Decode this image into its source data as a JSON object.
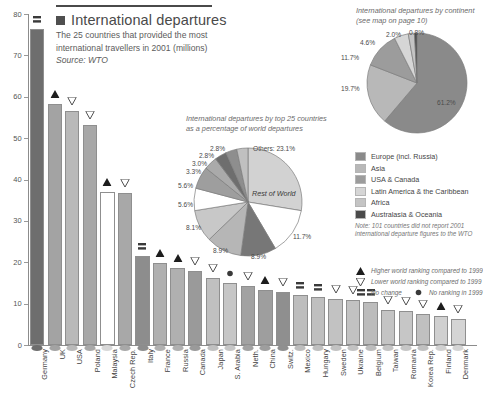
{
  "header": {
    "swatch_color": "#4f4f4f",
    "title": "International departures",
    "subtitle_line1": "The 25 countries that provided the most",
    "subtitle_line2": "international travellers in 2001  (millions)",
    "source": "Source: WTO"
  },
  "chart_data": [
    {
      "type": "bar",
      "title": "International departures",
      "subtitle": "The 25 countries that provided the most international travellers in 2001 (millions)",
      "xlabel": "",
      "ylabel": "",
      "ylim": [
        0,
        80
      ],
      "yticks": [
        "0",
        "10",
        "20",
        "30",
        "40",
        "50",
        "60",
        "70",
        "80"
      ],
      "grid": false,
      "categories": [
        "Germany",
        "UK",
        "USA",
        "Poland",
        "Malaysia",
        "Czech Rep.",
        "Italy",
        "France",
        "Russia",
        "Canada",
        "Japan",
        "S. Arabia",
        "Neth.",
        "China",
        "Switz.",
        "Mexico",
        "Hungary",
        "Sweden",
        "Ukraine",
        "Belgium",
        "Taiwan",
        "Romania",
        "Korea Rep.",
        "Finland",
        "Denmark"
      ],
      "values": [
        76.4,
        58.3,
        56.6,
        53.1,
        37.0,
        36.7,
        21.6,
        19.8,
        18.5,
        18.0,
        16.2,
        15.1,
        14.2,
        13.3,
        12.9,
        12.1,
        11.6,
        11.2,
        11.0,
        10.3,
        8.5,
        8.2,
        7.6,
        6.9,
        6.3
      ],
      "markers": [
        "no-change",
        "up",
        "down",
        "down",
        "up",
        "down",
        "no-change",
        "up",
        "up",
        "down",
        "down",
        "no-ranking",
        "down",
        "up",
        "down",
        "no-change",
        "no-change",
        "down",
        "down",
        "no-change",
        "down",
        "down",
        "down",
        "up",
        "down"
      ]
    },
    {
      "type": "pie",
      "title_line1": "International departures by top 25 countries",
      "title_line2": "as a percentage of world departures",
      "center_label": "Rest of World",
      "labels": [
        "Others: 23.1%",
        "11.7%",
        "8.9%",
        "8.9%",
        "8.1%",
        "5.6%",
        "5.6%",
        "3.3%",
        "3.0%",
        "2.8%",
        "2.8%"
      ],
      "values": [
        23.1,
        11.7,
        8.9,
        8.9,
        8.1,
        5.6,
        5.6,
        3.3,
        3.0,
        2.8,
        2.8
      ]
    },
    {
      "type": "pie",
      "title_line1": "International departures by continent",
      "title_line2": "(see map on page 10)",
      "labels": [
        "61.2%",
        "19.7%",
        "11.7%",
        "4.6%",
        "2.0%",
        "0.8%"
      ],
      "categories": [
        "Europe (incl. Russia)",
        "Asia",
        "USA & Canada",
        "Latin America & the Caribbean",
        "Africa",
        "Australasia & Oceania"
      ],
      "values": [
        61.2,
        19.7,
        11.7,
        4.6,
        2.0,
        0.8
      ],
      "colors": [
        "#8a8a8a",
        "#b8b8b8",
        "#9c9c9c",
        "#d6d6d6",
        "#c4c4c4",
        "#4a4a4a"
      ]
    }
  ],
  "continent_legend": {
    "items": [
      {
        "label": "Europe (incl. Russia)",
        "color": "#8a8a8a"
      },
      {
        "label": "Asia",
        "color": "#b8b8b8"
      },
      {
        "label": "USA & Canada",
        "color": "#9c9c9c"
      },
      {
        "label": "Latin America & the Caribbean",
        "color": "#d6d6d6"
      },
      {
        "label": "Africa",
        "color": "#c4c4c4"
      },
      {
        "label": "Australasia & Oceania",
        "color": "#4a4a4a"
      }
    ],
    "note_line1": "Note: 101 countries did not report 2001",
    "note_line2": "international departure figures to the WTO"
  },
  "marker_legend": {
    "items": [
      {
        "icon": "triangle-up-icon",
        "label": "Higher world ranking compared to 1999"
      },
      {
        "icon": "triangle-down-icon",
        "label": "Lower world ranking compared to  1999"
      },
      {
        "icon": "square-icon",
        "label": "No change"
      },
      {
        "icon": "circle-icon",
        "label": "No ranking in 1999"
      }
    ]
  }
}
